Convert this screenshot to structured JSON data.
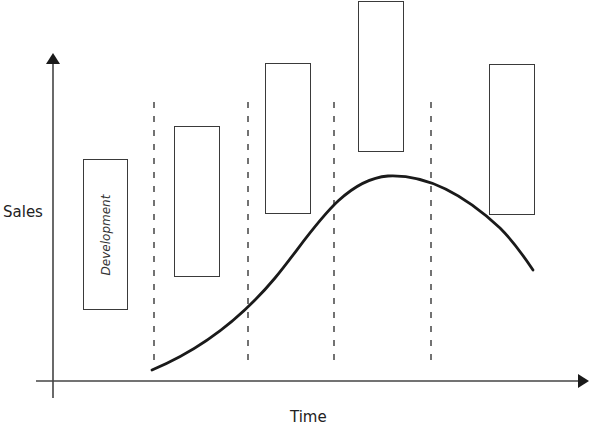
{
  "diagram": {
    "y_axis_label": "Sales",
    "x_axis_label": "Time",
    "colors": {
      "line": "#1a1a1a",
      "box_border": "#3a3a3a",
      "dashed": "#444444",
      "text": "#222222"
    },
    "stages": [
      {
        "label": "Development",
        "x": 83,
        "y": 159,
        "w": 45,
        "h": 151
      },
      {
        "label": "",
        "x": 174,
        "y": 126,
        "w": 46,
        "h": 151
      },
      {
        "label": "",
        "x": 265,
        "y": 63,
        "w": 46,
        "h": 151
      },
      {
        "label": "",
        "x": 358,
        "y": 1,
        "w": 46,
        "h": 151
      },
      {
        "label": "",
        "x": 489,
        "y": 64,
        "w": 46,
        "h": 151
      }
    ],
    "dividers_x": [
      154,
      248,
      334,
      431
    ],
    "curve": {
      "start": [
        152,
        370
      ],
      "peak": [
        388,
        176
      ],
      "end": [
        533,
        270
      ]
    }
  }
}
